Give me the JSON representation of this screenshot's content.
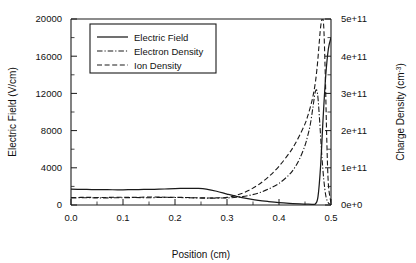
{
  "chart_data": {
    "type": "line",
    "title": "",
    "xlabel": "Position (cm)",
    "ylabel": "Electric Field (V/cm)",
    "y2label": "Charge Density (cm-3)",
    "y2label_base": "Charge Density (cm",
    "y2label_sup": "-3",
    "y2label_close": ")",
    "xlim": [
      0.0,
      0.5
    ],
    "ylim": [
      0,
      20000
    ],
    "y2lim": [
      0,
      500000000000
    ],
    "grid": false,
    "legend_position": "upper-left-inside",
    "xticks": [
      0.0,
      0.1,
      0.2,
      0.3,
      0.4,
      0.5
    ],
    "xticklabels": [
      "0.0",
      "0.1",
      "0.2",
      "0.3",
      "0.4",
      "0.5"
    ],
    "xminorticks": [
      0.05,
      0.15,
      0.25,
      0.35,
      0.45
    ],
    "yticks": [
      0,
      4000,
      8000,
      12000,
      16000,
      20000
    ],
    "yticklabels": [
      "0",
      "4000",
      "8000",
      "12000",
      "16000",
      "20000"
    ],
    "yminorticks": [
      2000,
      6000,
      10000,
      14000,
      18000
    ],
    "y2ticks": [
      0,
      100000000000,
      200000000000,
      300000000000,
      400000000000,
      500000000000
    ],
    "y2ticklabels": [
      "0e+0",
      "1e+11",
      "2e+11",
      "3e+11",
      "4e+11",
      "5e+11"
    ],
    "y2minorticks": [
      50000000000,
      150000000000,
      250000000000,
      350000000000,
      450000000000
    ],
    "series": [
      {
        "name": "Electric Field",
        "axis": "left",
        "dash": "solid",
        "x": [
          0.0,
          0.02,
          0.04,
          0.06,
          0.08,
          0.1,
          0.12,
          0.14,
          0.16,
          0.18,
          0.2,
          0.215,
          0.23,
          0.245,
          0.26,
          0.28,
          0.3,
          0.32,
          0.34,
          0.36,
          0.38,
          0.4,
          0.42,
          0.44,
          0.455,
          0.465,
          0.47,
          0.475,
          0.48,
          0.485,
          0.49,
          0.495,
          0.5
        ],
        "values": [
          1720,
          1680,
          1660,
          1650,
          1640,
          1640,
          1650,
          1670,
          1690,
          1720,
          1760,
          1790,
          1800,
          1780,
          1700,
          1480,
          1180,
          900,
          680,
          500,
          370,
          260,
          180,
          120,
          90,
          80,
          120,
          900,
          4200,
          9500,
          14000,
          16800,
          18000
        ]
      },
      {
        "name": "Electron Density",
        "axis": "right",
        "dash": "dashdot",
        "x": [
          0.0,
          0.03,
          0.06,
          0.09,
          0.12,
          0.15,
          0.18,
          0.21,
          0.24,
          0.27,
          0.3,
          0.32,
          0.34,
          0.36,
          0.38,
          0.4,
          0.42,
          0.43,
          0.44,
          0.45,
          0.455,
          0.46,
          0.465,
          0.47,
          0.474,
          0.478,
          0.482,
          0.486,
          0.49,
          0.494,
          0.497,
          0.5
        ],
        "values": [
          19000000000,
          19500000000,
          19000000000,
          19500000000,
          20000000000,
          19500000000,
          20500000000,
          20000000000,
          19000000000,
          18500000000,
          19000000000,
          21000000000,
          25000000000,
          32000000000,
          43000000000,
          58000000000,
          82000000000,
          100000000000,
          125000000000,
          160000000000,
          185000000000,
          215000000000,
          260000000000,
          305000000000,
          300000000000,
          230000000000,
          140000000000,
          70000000000,
          25000000000,
          8000000000,
          3000000000,
          1500000000
        ]
      },
      {
        "name": "Ion Density",
        "axis": "right",
        "dash": "dashed",
        "x": [
          0.0,
          0.03,
          0.06,
          0.09,
          0.12,
          0.15,
          0.18,
          0.21,
          0.24,
          0.27,
          0.3,
          0.32,
          0.34,
          0.36,
          0.38,
          0.4,
          0.42,
          0.43,
          0.44,
          0.45,
          0.455,
          0.46,
          0.465,
          0.47,
          0.474,
          0.477,
          0.48,
          0.483,
          0.486,
          0.489,
          0.492,
          0.495,
          0.5
        ],
        "values": [
          20000000000,
          20500000000,
          20000000000,
          21000000000,
          20500000000,
          21500000000,
          21000000000,
          20500000000,
          19500000000,
          19000000000,
          20500000000,
          27000000000,
          38000000000,
          54000000000,
          76000000000,
          104000000000,
          140000000000,
          162000000000,
          188000000000,
          218000000000,
          238000000000,
          262000000000,
          290000000000,
          330000000000,
          380000000000,
          430000000000,
          478000000000,
          500000000000,
          480000000000,
          350000000000,
          170000000000,
          55000000000,
          6000000000
        ]
      }
    ],
    "legend": [
      {
        "label": "Electric Field",
        "dash": "solid"
      },
      {
        "label": "Electron Density",
        "dash": "dashdot"
      },
      {
        "label": "Ion Density",
        "dash": "dashed"
      }
    ],
    "colors": {
      "line": "#1a1a1a",
      "background": "#ffffff",
      "axis": "#1a1a1a"
    }
  }
}
